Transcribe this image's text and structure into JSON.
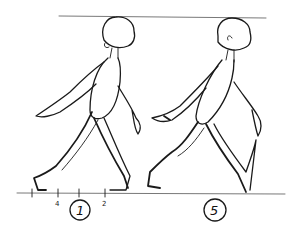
{
  "sketch": {
    "subject": "walk-cycle-drawing",
    "top_guide_line": true,
    "ground_line": true,
    "tick_labels": [
      "4",
      "2"
    ],
    "frames": [
      {
        "number": "1",
        "position": "left"
      },
      {
        "number": "5",
        "position": "right"
      }
    ],
    "colors": {
      "ink": "#1a1a1a",
      "paper": "#ffffff"
    }
  }
}
